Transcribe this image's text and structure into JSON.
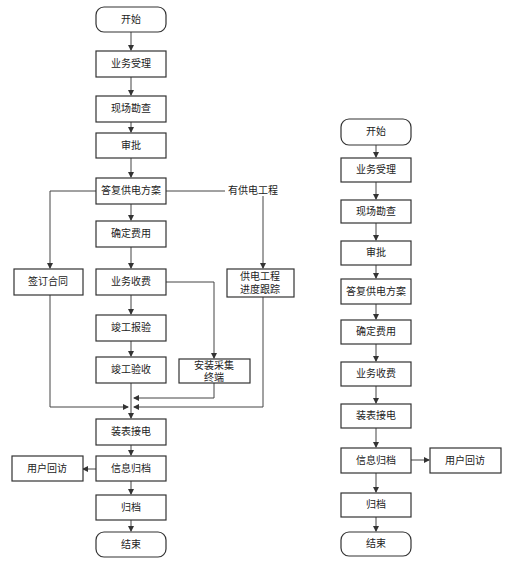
{
  "left_flow": {
    "start": "开始",
    "accept": "业务受理",
    "survey": "现场勘查",
    "approve": "审批",
    "reply_plan": "答复供电方案",
    "branch_label": "有供电工程",
    "confirm_fee": "确定费用",
    "sign_contract": "签订合同",
    "collect_fee": "业务收费",
    "project_track_1": "供电工程",
    "project_track_2": "进度跟踪",
    "completion_report": "竣工报验",
    "completion_check": "竣工验收",
    "install_terminal_1": "安装采集",
    "install_terminal_2": "终端",
    "meter_install": "装表接电",
    "customer_visit": "用户回访",
    "info_archive": "信息归档",
    "archive": "归档",
    "end": "结束"
  },
  "right_flow": {
    "start": "开始",
    "accept": "业务受理",
    "survey": "现场勘查",
    "approve": "审批",
    "reply_plan": "答复供电方案",
    "confirm_fee": "确定费用",
    "collect_fee": "业务收费",
    "meter_install": "装表接电",
    "info_archive": "信息归档",
    "customer_visit": "用户回访",
    "archive": "归档",
    "end": "结束"
  }
}
